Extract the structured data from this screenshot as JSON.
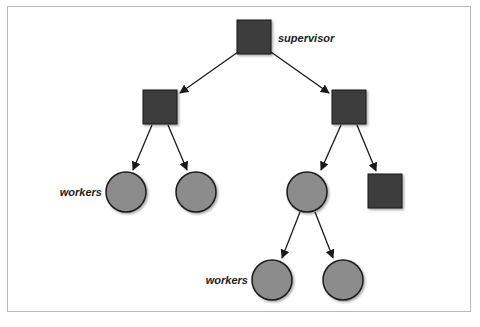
{
  "diagram": {
    "title": "",
    "colors": {
      "supervisor_fill": "#3d3d3d",
      "worker_fill": "#8c8c8c",
      "stroke": "#1a1a1a",
      "edge": "#1a1a1a",
      "frame_border": "#b8b8b8"
    },
    "labels": {
      "supervisor": "supervisor",
      "workers_top": "workers",
      "workers_bottom": "workers"
    },
    "nodes": [
      {
        "id": "root",
        "type": "supervisor",
        "shape": "square",
        "x": 254,
        "y": 37
      },
      {
        "id": "sup-left",
        "type": "supervisor",
        "shape": "square",
        "x": 160,
        "y": 107
      },
      {
        "id": "sup-right",
        "type": "supervisor",
        "shape": "square",
        "x": 349,
        "y": 107
      },
      {
        "id": "worker-1",
        "type": "worker",
        "shape": "circle",
        "x": 126,
        "y": 192
      },
      {
        "id": "worker-2",
        "type": "worker",
        "shape": "circle",
        "x": 196,
        "y": 192
      },
      {
        "id": "worker-3",
        "type": "worker",
        "shape": "circle",
        "x": 307,
        "y": 192
      },
      {
        "id": "sup-leaf",
        "type": "supervisor",
        "shape": "square",
        "x": 385,
        "y": 191
      },
      {
        "id": "worker-4",
        "type": "worker",
        "shape": "circle",
        "x": 272,
        "y": 280
      },
      {
        "id": "worker-5",
        "type": "worker",
        "shape": "circle",
        "x": 343,
        "y": 280
      }
    ],
    "edges": [
      {
        "from": "root",
        "to": "sup-left"
      },
      {
        "from": "root",
        "to": "sup-right"
      },
      {
        "from": "sup-left",
        "to": "worker-1"
      },
      {
        "from": "sup-left",
        "to": "worker-2"
      },
      {
        "from": "sup-right",
        "to": "worker-3"
      },
      {
        "from": "sup-right",
        "to": "sup-leaf"
      },
      {
        "from": "worker-3",
        "to": "worker-4"
      },
      {
        "from": "worker-3",
        "to": "worker-5"
      }
    ]
  }
}
